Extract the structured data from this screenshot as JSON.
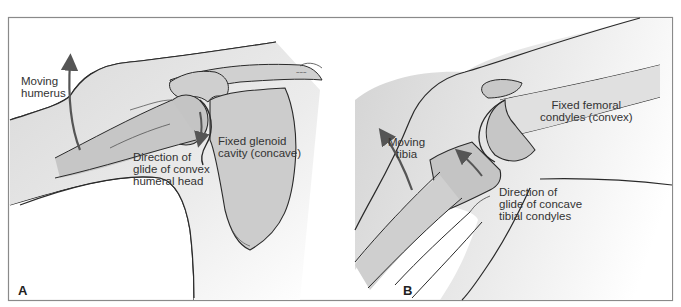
{
  "figure": {
    "colors": {
      "frame": "#8a8a8a",
      "line": "#2a2a2a",
      "skin": "#e6e6e6",
      "bone": "#cccccc",
      "bone_dark": "#bdbdbd",
      "arrow": "#555555",
      "text": "#333333"
    },
    "panels": [
      {
        "letter": "A",
        "subject": "shoulder",
        "labels": {
          "moving": [
            "Moving",
            "humerus"
          ],
          "fixed": [
            "Fixed glenoid",
            "cavity (concave)"
          ],
          "direction": [
            "Direction of",
            "glide of convex",
            "humeral head"
          ]
        }
      },
      {
        "letter": "B",
        "subject": "knee",
        "labels": {
          "moving": [
            "Moving",
            "tibia"
          ],
          "fixed": [
            "Fixed femoral",
            "condyles (convex)"
          ],
          "direction": [
            "Direction of",
            "glide of concave",
            "tibial condyles"
          ]
        }
      }
    ]
  }
}
